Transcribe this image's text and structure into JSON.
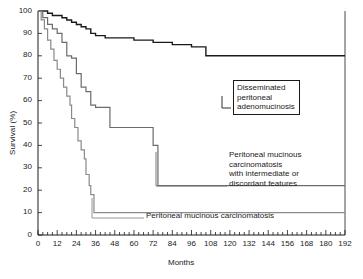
{
  "chart_data": {
    "type": "line",
    "title": "",
    "subtitle": "",
    "xlabel": "Months",
    "ylabel": "Survival (%)",
    "xlim": [
      0,
      192
    ],
    "ylim": [
      0,
      100
    ],
    "xticks": [
      0,
      12,
      24,
      36,
      48,
      60,
      72,
      84,
      96,
      108,
      120,
      132,
      144,
      156,
      168,
      180,
      192
    ],
    "yticks": [
      0,
      10,
      20,
      30,
      40,
      50,
      60,
      70,
      80,
      90,
      100
    ],
    "xtick_labels": [
      "0",
      "12",
      "24",
      "36",
      "48",
      "60",
      "72",
      "84",
      "96",
      "108",
      "120",
      "132",
      "144",
      "156",
      "168",
      "180",
      "192"
    ],
    "ytick_labels": [
      "0",
      "10",
      "20",
      "30",
      "40",
      "50",
      "60",
      "70",
      "80",
      "90",
      "100"
    ],
    "xminor_step": 3,
    "grid": false,
    "legend_position": "annotations-inline",
    "step_style": "post",
    "series": [
      {
        "name": "Disseminated peritoneal adenomucinosis",
        "color": "#1a1a1a",
        "width": 1.4,
        "points": [
          [
            0,
            100
          ],
          [
            6,
            100
          ],
          [
            6,
            99
          ],
          [
            9,
            99
          ],
          [
            9,
            98
          ],
          [
            12,
            98
          ],
          [
            15,
            98
          ],
          [
            15,
            97
          ],
          [
            18,
            97
          ],
          [
            18,
            96
          ],
          [
            21,
            96
          ],
          [
            21,
            95
          ],
          [
            24,
            95
          ],
          [
            24,
            94
          ],
          [
            27,
            94
          ],
          [
            27,
            93
          ],
          [
            30,
            93
          ],
          [
            30,
            92
          ],
          [
            33,
            92
          ],
          [
            33,
            90
          ],
          [
            36,
            90
          ],
          [
            36,
            89
          ],
          [
            42,
            89
          ],
          [
            42,
            88
          ],
          [
            60,
            88
          ],
          [
            60,
            87
          ],
          [
            72,
            87
          ],
          [
            72,
            86
          ],
          [
            84,
            86
          ],
          [
            84,
            85
          ],
          [
            96,
            85
          ],
          [
            96,
            84
          ],
          [
            105,
            84
          ],
          [
            105,
            80
          ],
          [
            144,
            80
          ],
          [
            192,
            80
          ]
        ]
      },
      {
        "name": "Peritoneal mucinous carcinomatosis with intermediate or discordant features",
        "color": "#6b6b6b",
        "width": 1.2,
        "points": [
          [
            0,
            100
          ],
          [
            3,
            100
          ],
          [
            3,
            97
          ],
          [
            6,
            97
          ],
          [
            6,
            94
          ],
          [
            9,
            94
          ],
          [
            9,
            92
          ],
          [
            12,
            92
          ],
          [
            12,
            90
          ],
          [
            15,
            90
          ],
          [
            15,
            86
          ],
          [
            18,
            86
          ],
          [
            18,
            80
          ],
          [
            21,
            80
          ],
          [
            21,
            79
          ],
          [
            24,
            79
          ],
          [
            24,
            72
          ],
          [
            27,
            72
          ],
          [
            27,
            66
          ],
          [
            30,
            66
          ],
          [
            30,
            64
          ],
          [
            33,
            64
          ],
          [
            33,
            58
          ],
          [
            36,
            58
          ],
          [
            36,
            57
          ],
          [
            45,
            57
          ],
          [
            45,
            48
          ],
          [
            72,
            48
          ],
          [
            72,
            40
          ],
          [
            75,
            40
          ],
          [
            75,
            22
          ],
          [
            192,
            22
          ]
        ]
      },
      {
        "name": "Peritoneal mucinous carcinomatosis",
        "color": "#8a8a8a",
        "width": 1.2,
        "points": [
          [
            0,
            100
          ],
          [
            2,
            100
          ],
          [
            2,
            96
          ],
          [
            4,
            96
          ],
          [
            4,
            92
          ],
          [
            6,
            92
          ],
          [
            6,
            87
          ],
          [
            8,
            87
          ],
          [
            8,
            83
          ],
          [
            10,
            83
          ],
          [
            10,
            78
          ],
          [
            12,
            78
          ],
          [
            12,
            74
          ],
          [
            14,
            74
          ],
          [
            14,
            70
          ],
          [
            16,
            70
          ],
          [
            16,
            66
          ],
          [
            18,
            66
          ],
          [
            18,
            62
          ],
          [
            20,
            62
          ],
          [
            20,
            58
          ],
          [
            21,
            58
          ],
          [
            21,
            52
          ],
          [
            23,
            52
          ],
          [
            23,
            48
          ],
          [
            25,
            48
          ],
          [
            25,
            42
          ],
          [
            27,
            42
          ],
          [
            27,
            38
          ],
          [
            29,
            38
          ],
          [
            29,
            34
          ],
          [
            30,
            34
          ],
          [
            30,
            27
          ],
          [
            32,
            27
          ],
          [
            32,
            22
          ],
          [
            33,
            22
          ],
          [
            33,
            18
          ],
          [
            35,
            18
          ],
          [
            35,
            10
          ],
          [
            192,
            10
          ]
        ]
      }
    ],
    "annotations": [
      {
        "id": "dpam-label",
        "lines": [
          "Disseminated",
          "peritoneal",
          "adenomucinosis"
        ],
        "boxed": true
      },
      {
        "id": "pmca-i-label",
        "lines": [
          "Peritoneal mucinous",
          "carcinomatosis",
          "with intermediate or",
          "discordant features"
        ],
        "boxed": false
      },
      {
        "id": "pmca-label",
        "lines": [
          "Peritoneal mucinous carcinomatosis"
        ],
        "boxed": false
      }
    ]
  }
}
